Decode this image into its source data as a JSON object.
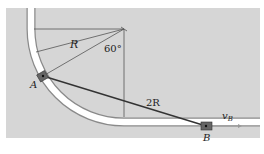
{
  "diagram": {
    "type": "mechanics-figure",
    "labels": {
      "radius": "R",
      "angle": "60°",
      "rod_length": "2R",
      "point_a": "A",
      "point_b": "B",
      "velocity": "v",
      "velocity_sub": "B"
    },
    "colors": {
      "background": "#d6d6d6",
      "track": "#ffffff",
      "lines": "#333333",
      "slider": "#555555"
    }
  }
}
